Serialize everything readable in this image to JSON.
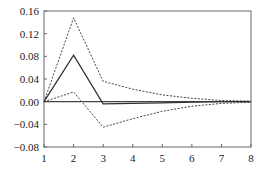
{
  "chart_data": {
    "type": "line",
    "title": "",
    "xlabel": "",
    "ylabel": "",
    "x": [
      1,
      2,
      3,
      4,
      5,
      6,
      7,
      8
    ],
    "xlim": [
      1,
      8
    ],
    "ylim": [
      -0.08,
      0.16
    ],
    "xticks": [
      "1",
      "2",
      "3",
      "4",
      "5",
      "6",
      "7",
      "8"
    ],
    "yticks": [
      "0.16",
      "0.12",
      "0.08",
      "0.04",
      "0.00",
      "-0.04",
      "-0.08"
    ],
    "ytick_values": [
      0.16,
      0.12,
      0.08,
      0.04,
      0.0,
      -0.04,
      -0.08
    ],
    "grid": false,
    "legend": null,
    "zero_line": true,
    "series": [
      {
        "name": "upper band",
        "style": "dashed",
        "color": "#444444",
        "values": [
          0.0,
          0.148,
          0.036,
          0.022,
          0.012,
          0.006,
          0.002,
          0.001
        ]
      },
      {
        "name": "response",
        "style": "solid",
        "color": "#333333",
        "values": [
          0.0,
          0.082,
          -0.004,
          -0.003,
          -0.002,
          -0.001,
          0.0,
          0.0
        ]
      },
      {
        "name": "lower band",
        "style": "dashed",
        "color": "#444444",
        "values": [
          0.0,
          0.017,
          -0.045,
          -0.03,
          -0.017,
          -0.008,
          -0.003,
          -0.001
        ]
      }
    ]
  }
}
